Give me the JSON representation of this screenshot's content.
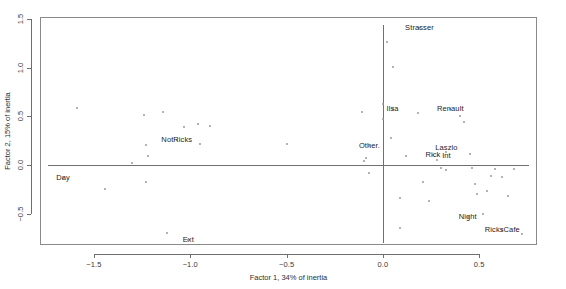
{
  "chart_data": {
    "type": "scatter",
    "title": "",
    "xlabel": "Factor 1, 34% of inertia",
    "ylabel": "Factor 2, 15% of inertia",
    "xlim": [
      -1.78,
      0.8
    ],
    "ylim": [
      -0.82,
      1.52
    ],
    "xticks": [
      -1.5,
      -1.0,
      -0.5,
      0.0,
      0.5
    ],
    "xticklabels": [
      "−1.5",
      "−1.0",
      "−0.5",
      "0.0",
      "0.5"
    ],
    "yticks": [
      -0.5,
      0.0,
      0.5,
      1.0,
      1.5
    ],
    "yticklabels": [
      "−0.5",
      "0.0",
      "0.5",
      "1.0",
      "1.5"
    ],
    "grid": false,
    "legend": false,
    "reference_lines": [
      {
        "name": "vertical-zero-line",
        "orientation": "vertical",
        "value": 0.0
      },
      {
        "name": "horizontal-zero-line",
        "orientation": "horizontal",
        "value": 0.0
      }
    ],
    "labeled_points": [
      {
        "label": "Strasser",
        "x": 0.19,
        "y": 1.41,
        "label_dx": 0,
        "label_dy": 0
      },
      {
        "label": "Ilsa",
        "x": 0.05,
        "y": 0.58,
        "label_dx": 0,
        "label_dy": 0
      },
      {
        "label": "Renault",
        "x": 0.35,
        "y": 0.58,
        "label_dx": 0,
        "label_dy": 0
      },
      {
        "label": "Other.",
        "x": -0.07,
        "y": 0.2,
        "label_dx": 0,
        "label_dy": 0
      },
      {
        "label": "Rick",
        "x": 0.26,
        "y": 0.1,
        "label_dx": 0,
        "label_dy": 0
      },
      {
        "label": "Laszlo\nInt",
        "x": 0.33,
        "y": 0.13,
        "label_dx": 0,
        "label_dy": 0
      },
      {
        "label": "Night",
        "x": 0.44,
        "y": -0.53,
        "label_dx": 0,
        "label_dy": 0
      },
      {
        "label": "RicksCafe",
        "x": 0.62,
        "y": -0.67,
        "label_dx": 0,
        "label_dy": 0
      },
      {
        "label": "NotRicks",
        "x": -1.07,
        "y": 0.26,
        "label_dx": 0,
        "label_dy": 0
      },
      {
        "label": "Day",
        "x": -1.66,
        "y": -0.13,
        "label_dx": 0,
        "label_dy": 0
      },
      {
        "label": "Ext",
        "x": -1.01,
        "y": -0.77,
        "label_dx": 0,
        "label_dy": 0
      }
    ],
    "points": [
      {
        "x": -1.59,
        "y": 0.59
      },
      {
        "x": -1.44,
        "y": -0.25
      },
      {
        "x": -1.24,
        "y": 0.51
      },
      {
        "x": -1.23,
        "y": 0.21
      },
      {
        "x": -1.22,
        "y": 0.09
      },
      {
        "x": -1.23,
        "y": -0.17
      },
      {
        "x": -1.14,
        "y": 0.55
      },
      {
        "x": -1.12,
        "y": -0.7
      },
      {
        "x": -1.03,
        "y": 0.39
      },
      {
        "x": -0.96,
        "y": 0.42
      },
      {
        "x": -0.95,
        "y": 0.22
      },
      {
        "x": -0.9,
        "y": 0.4
      },
      {
        "x": -1.3,
        "y": 0.02
      },
      {
        "x": -0.11,
        "y": 0.54
      },
      {
        "x": -0.1,
        "y": 0.04
      },
      {
        "x": -0.09,
        "y": 0.07
      },
      {
        "x": -0.07,
        "y": -0.08
      },
      {
        "x": 0.02,
        "y": 1.26
      },
      {
        "x": 0.05,
        "y": 1.01
      },
      {
        "x": 0.0,
        "y": 0.63
      },
      {
        "x": 0.0,
        "y": 0.47
      },
      {
        "x": 0.04,
        "y": 0.28
      },
      {
        "x": 0.09,
        "y": -0.34
      },
      {
        "x": 0.09,
        "y": -0.65
      },
      {
        "x": 0.21,
        "y": -0.17
      },
      {
        "x": 0.24,
        "y": -0.37
      },
      {
        "x": 0.28,
        "y": 0.05
      },
      {
        "x": 0.3,
        "y": -0.03
      },
      {
        "x": 0.33,
        "y": -0.05
      },
      {
        "x": 0.4,
        "y": 0.5
      },
      {
        "x": 0.42,
        "y": 0.44
      },
      {
        "x": 0.45,
        "y": 0.11
      },
      {
        "x": 0.46,
        "y": -0.03
      },
      {
        "x": 0.48,
        "y": -0.19
      },
      {
        "x": 0.49,
        "y": -0.3
      },
      {
        "x": 0.52,
        "y": -0.5
      },
      {
        "x": 0.54,
        "y": -0.27
      },
      {
        "x": 0.56,
        "y": -0.11
      },
      {
        "x": 0.58,
        "y": -0.04
      },
      {
        "x": 0.62,
        "y": -0.12
      },
      {
        "x": 0.65,
        "y": -0.32
      },
      {
        "x": 0.68,
        "y": -0.04
      },
      {
        "x": 0.72,
        "y": -0.71
      },
      {
        "x": 0.18,
        "y": 0.53
      },
      {
        "x": 0.12,
        "y": 0.09
      },
      {
        "x": -0.5,
        "y": 0.22
      }
    ]
  }
}
